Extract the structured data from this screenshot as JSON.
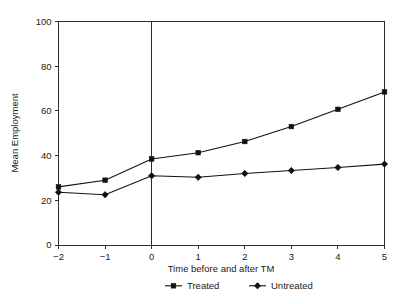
{
  "chart_data": {
    "type": "line",
    "title": "",
    "subtitle": "",
    "xlabel": "Time before and after TM",
    "ylabel": "Mean Employment",
    "x": [
      -2,
      -1,
      0,
      1,
      2,
      3,
      4,
      5
    ],
    "xtick_labels": [
      "−2",
      "−1",
      "0",
      "1",
      "2",
      "3",
      "4",
      "5"
    ],
    "ytick_labels": [
      "0",
      "20",
      "40",
      "60",
      "80",
      "100"
    ],
    "yticks": [
      0,
      20,
      40,
      60,
      80,
      100
    ],
    "xlim": [
      -2,
      5
    ],
    "ylim": [
      0,
      100
    ],
    "grid": false,
    "legend_position": "bottom",
    "annotations": [
      {
        "name": "event-line",
        "type": "vline",
        "x": 0,
        "label": ""
      }
    ],
    "series": [
      {
        "name": "Treated",
        "marker": "square",
        "color": "#111111",
        "values": [
          26.0,
          29.0,
          38.5,
          41.3,
          46.3,
          53.0,
          60.7,
          68.5
        ]
      },
      {
        "name": "Untreated",
        "marker": "diamond",
        "color": "#111111",
        "values": [
          23.6,
          22.5,
          31.0,
          30.3,
          32.0,
          33.3,
          34.7,
          36.2
        ]
      }
    ]
  },
  "axes": {
    "y_label": "Mean Employment",
    "x_label": "Time before and after TM"
  },
  "legend": {
    "items": [
      {
        "label": "Treated",
        "marker": "square"
      },
      {
        "label": "Untreated",
        "marker": "diamond"
      }
    ]
  }
}
